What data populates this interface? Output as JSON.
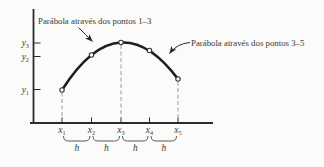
{
  "annotations": {
    "left": "Parábola através dos pontos 1–3",
    "right": "Parábola através dos pontos 3–5"
  },
  "axes": {
    "y_labels": [
      {
        "base": "y",
        "sub": "3"
      },
      {
        "base": "y",
        "sub": "2"
      },
      {
        "base": "y",
        "sub": "1"
      }
    ],
    "x_labels": [
      {
        "base": "x",
        "sub": "1"
      },
      {
        "base": "x",
        "sub": "2"
      },
      {
        "base": "x",
        "sub": "3"
      },
      {
        "base": "x",
        "sub": "4"
      },
      {
        "base": "x",
        "sub": "5"
      }
    ],
    "h_labels": [
      "h",
      "h",
      "h",
      "h"
    ]
  },
  "colors": {
    "background": "#fbfbf9",
    "curve": "#1e1e1e",
    "axis": "#2b2b2b",
    "dashed": "#9c9c9c",
    "text": "#3a3a3a",
    "brace": "#5a5a5a"
  }
}
